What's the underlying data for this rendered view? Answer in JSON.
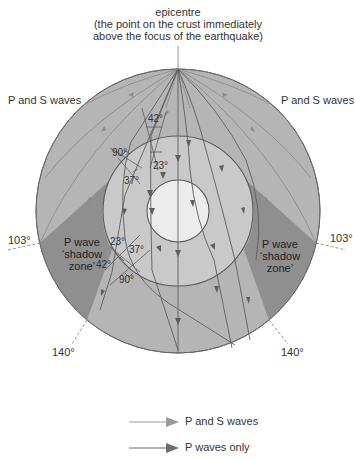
{
  "title": {
    "line1": "epicentre",
    "line2": "(the point on the crust immediately",
    "line3": "above the focus of the earthquake)"
  },
  "labels": {
    "left_waves": "P and S waves",
    "right_waves": "P and S waves",
    "left_103": "103°",
    "right_103": "103°",
    "left_140": "140°",
    "right_140": "140°",
    "shadow_left": [
      "P wave",
      "‘shadow",
      "zone’"
    ],
    "shadow_right": [
      "P wave",
      "‘shadow",
      "zone’"
    ]
  },
  "angles": {
    "top_42": "42°",
    "top_23": "23°",
    "top_90": "90°",
    "top_37": "37°",
    "bottom_23": "23°",
    "bottom_37": "37°",
    "bottom_42": "42°",
    "bottom_90": "90°"
  },
  "legend": {
    "items": [
      {
        "label": "P and S waves",
        "color": "#9a9a9a"
      },
      {
        "label": "P waves only",
        "color": "#6e6e6e"
      }
    ]
  },
  "colors": {
    "mantle": "#b5b5b5",
    "outer_core": "#c9c9c9",
    "inner_core": "#ececec",
    "shadow_zone": "#8f8f8f",
    "line": "#666666",
    "ps_wave": "#8c8c8c",
    "p_wave": "#5e5e5e"
  }
}
